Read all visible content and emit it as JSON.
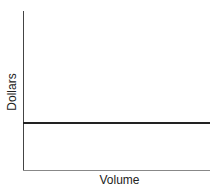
{
  "chart_data": {
    "type": "line",
    "title": "",
    "xlabel": "Volume",
    "ylabel": "Dollars",
    "series": [
      {
        "name": "constant",
        "x": [
          0,
          1
        ],
        "values": [
          0.3,
          0.3
        ]
      }
    ],
    "xlim": [
      0,
      1
    ],
    "ylim": [
      0,
      1
    ],
    "grid": false,
    "ticks": false
  }
}
